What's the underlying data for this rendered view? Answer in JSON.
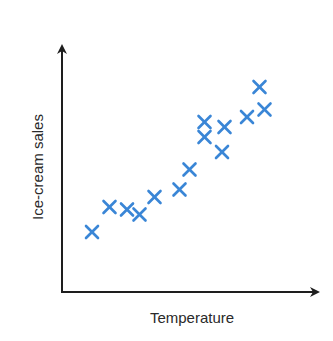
{
  "chart_data": {
    "type": "scatter",
    "title": "",
    "xlabel": "Temperature",
    "ylabel": "Ice-cream sales",
    "grid": false,
    "legend": null,
    "xlim": [
      0,
      10
    ],
    "ylim": [
      0,
      10
    ],
    "ticks": "none",
    "marker": "x",
    "marker_color": "#3a86d6",
    "axis_color": "#1e1e1e",
    "points": [
      {
        "x": 1.2,
        "y": 2.4
      },
      {
        "x": 1.9,
        "y": 3.4
      },
      {
        "x": 2.6,
        "y": 3.3
      },
      {
        "x": 3.1,
        "y": 3.1
      },
      {
        "x": 3.7,
        "y": 3.8
      },
      {
        "x": 4.7,
        "y": 4.1
      },
      {
        "x": 5.1,
        "y": 4.9
      },
      {
        "x": 5.7,
        "y": 6.2
      },
      {
        "x": 5.7,
        "y": 6.8
      },
      {
        "x": 6.4,
        "y": 5.6
      },
      {
        "x": 6.5,
        "y": 6.6
      },
      {
        "x": 7.4,
        "y": 7.0
      },
      {
        "x": 7.9,
        "y": 8.2
      },
      {
        "x": 8.1,
        "y": 7.3
      }
    ]
  },
  "labels": {
    "x_axis": "Temperature",
    "y_axis": "Ice-cream sales"
  }
}
